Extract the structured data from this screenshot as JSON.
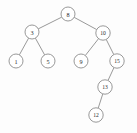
{
  "figure": {
    "type": "binary-search-tree-diagram",
    "width": 137,
    "height": 133,
    "background_color": "#fdfdfd",
    "node_fill_color": "#ffffff",
    "node_stroke_color": "#8d8d8d",
    "edge_color": "#8d8d8d",
    "label_color": "#2b2b2b"
  },
  "chart_data": {
    "type": "diagram",
    "title": "",
    "nodes": [
      {
        "id": "n8",
        "label": "8",
        "x": 68,
        "y": 14,
        "r": 7.0,
        "depth": 0
      },
      {
        "id": "n3",
        "label": "3",
        "x": 32,
        "y": 32,
        "r": 7.0,
        "depth": 1
      },
      {
        "id": "n10",
        "label": "10",
        "x": 103,
        "y": 33,
        "r": 7.2,
        "depth": 1
      },
      {
        "id": "n1",
        "label": "1",
        "x": 16,
        "y": 61,
        "r": 7.0,
        "depth": 2
      },
      {
        "id": "n5",
        "label": "5",
        "x": 48,
        "y": 61,
        "r": 7.0,
        "depth": 2
      },
      {
        "id": "n9",
        "label": "9",
        "x": 81,
        "y": 61,
        "r": 7.0,
        "depth": 2
      },
      {
        "id": "n15",
        "label": "15",
        "x": 117,
        "y": 61,
        "r": 7.2,
        "depth": 2
      },
      {
        "id": "n13",
        "label": "13",
        "x": 105,
        "y": 87,
        "r": 7.2,
        "depth": 3
      },
      {
        "id": "n12",
        "label": "12",
        "x": 96,
        "y": 115,
        "r": 7.2,
        "depth": 4
      }
    ],
    "edges": [
      {
        "from": "n8",
        "to": "n3",
        "side": "left"
      },
      {
        "from": "n8",
        "to": "n10",
        "side": "right"
      },
      {
        "from": "n3",
        "to": "n1",
        "side": "left"
      },
      {
        "from": "n3",
        "to": "n5",
        "side": "right"
      },
      {
        "from": "n10",
        "to": "n9",
        "side": "left"
      },
      {
        "from": "n10",
        "to": "n15",
        "side": "right"
      },
      {
        "from": "n15",
        "to": "n13",
        "side": "left"
      },
      {
        "from": "n13",
        "to": "n12",
        "side": "left"
      }
    ],
    "root": "n8",
    "values": [
      8,
      3,
      10,
      1,
      5,
      9,
      15,
      13,
      12
    ]
  }
}
